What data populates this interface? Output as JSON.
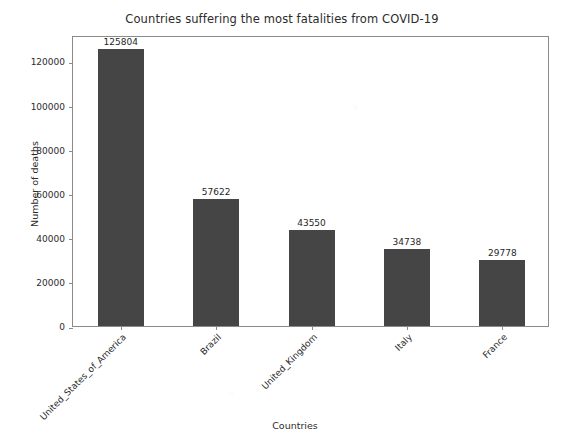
{
  "chart_data": {
    "type": "bar",
    "title": "Countries suffering the most fatalities from COVID-19",
    "xlabel": "Countries",
    "ylabel": "Number of deaths",
    "categories": [
      "United_States_of_America",
      "Brazil",
      "United_Kingdom",
      "Italy",
      "France"
    ],
    "values": [
      125804,
      57622,
      43550,
      34738,
      29778
    ],
    "value_labels": [
      "125804",
      "57622",
      "43550",
      "34738",
      "29778"
    ],
    "ylim": [
      0,
      132000
    ],
    "yticks": [
      0,
      20000,
      40000,
      60000,
      80000,
      100000,
      120000
    ],
    "ytick_labels": [
      "0",
      "20000",
      "40000",
      "60000",
      "80000",
      "100000",
      "120000"
    ],
    "grid": false,
    "legend": false,
    "bar_color": "#454545",
    "frame_color": "#8a8a8a",
    "background_color": "#ffffff",
    "xtick_rotation": -45
  }
}
